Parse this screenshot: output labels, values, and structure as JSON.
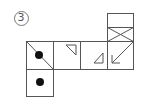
{
  "figure": {
    "label": "3",
    "type": "cube-net",
    "stroke_color": "#555555",
    "dot_color": "#111111",
    "faces": [
      {
        "id": "face-top-blank",
        "col": 3,
        "row": -2,
        "half": "top",
        "marking": "blank"
      },
      {
        "id": "face-top-x",
        "col": 3,
        "row": -1,
        "half": "bottom",
        "marking": "x-cross"
      },
      {
        "id": "face-dot-diagonal",
        "col": 0,
        "row": 0,
        "marking": "diagonal-with-dot"
      },
      {
        "id": "face-triangle-upper",
        "col": 1,
        "row": 0,
        "marking": "small-triangle-top"
      },
      {
        "id": "face-triangle-lower",
        "col": 2,
        "row": 0,
        "marking": "small-triangle-bottom"
      },
      {
        "id": "face-arrow",
        "col": 3,
        "row": 0,
        "marking": "diagonal-arrow-down-left"
      },
      {
        "id": "face-dot",
        "col": 0,
        "row": 1,
        "marking": "dot"
      }
    ]
  }
}
